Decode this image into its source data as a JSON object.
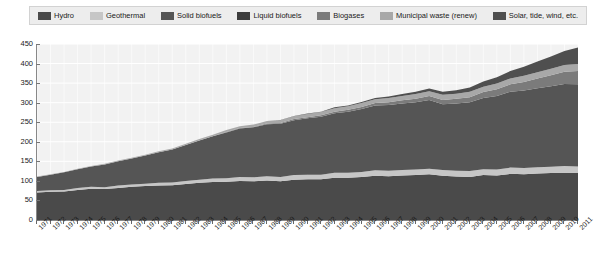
{
  "legend": {
    "items": [
      {
        "label": "Hydro",
        "color": "#4a4a4a",
        "key": "hydro"
      },
      {
        "label": "Geothermal",
        "color": "#c6c6c6",
        "key": "geothermal"
      },
      {
        "label": "Solid biofuels",
        "color": "#555555",
        "key": "solid_biofuels"
      },
      {
        "label": "Liquid biofuels",
        "color": "#3c3c3c",
        "key": "liquid_biofuels"
      },
      {
        "label": "Biogases",
        "color": "#7b7b7b",
        "key": "biogases"
      },
      {
        "label": "Municipal waste (renew)",
        "color": "#a8a8a8",
        "key": "municipal_waste"
      },
      {
        "label": "Solar, tide, wind, etc.",
        "color": "#4f4f4f",
        "key": "solar_tide_wind"
      }
    ]
  },
  "chart_data": {
    "type": "area",
    "stacked": true,
    "title": "",
    "subtitle": "",
    "xlabel": "",
    "ylabel": "",
    "grid": true,
    "legend_position": "top",
    "ylim": [
      0,
      450
    ],
    "ytick_labels": [
      "0",
      "50",
      "100",
      "150",
      "200",
      "250",
      "300",
      "350",
      "400",
      "450"
    ],
    "ytick_values": [
      0,
      50,
      100,
      150,
      200,
      250,
      300,
      350,
      400,
      450
    ],
    "categories": [
      "1971",
      "1972",
      "1973",
      "1974",
      "1975",
      "1976",
      "1977",
      "1978",
      "1979",
      "1980",
      "1981",
      "1982",
      "1983",
      "1984",
      "1985",
      "1986",
      "1987",
      "1988",
      "1989",
      "1990",
      "1991",
      "1992",
      "1993",
      "1994",
      "1995",
      "1996",
      "1997",
      "1998",
      "1999",
      "2000",
      "2001",
      "2002",
      "2003",
      "2004",
      "2005",
      "2006",
      "2007",
      "2008",
      "2009",
      "2010",
      "2011"
    ],
    "series": [
      {
        "name": "Hydro",
        "color": "#4a4a4a",
        "values": [
          70,
          72,
          73,
          77,
          80,
          79,
          82,
          85,
          87,
          88,
          89,
          92,
          95,
          97,
          98,
          100,
          99,
          101,
          99,
          103,
          104,
          104,
          108,
          108,
          110,
          113,
          112,
          114,
          115,
          117,
          113,
          111,
          110,
          115,
          114,
          118,
          117,
          119,
          120,
          121,
          120
        ]
      },
      {
        "name": "Geothermal",
        "color": "#c6c6c6",
        "values": [
          4,
          4,
          4,
          5,
          5,
          5,
          6,
          6,
          6,
          7,
          7,
          8,
          8,
          9,
          9,
          10,
          10,
          11,
          11,
          12,
          12,
          12,
          13,
          13,
          13,
          14,
          14,
          14,
          14,
          14,
          15,
          15,
          15,
          15,
          15,
          16,
          16,
          16,
          16,
          17,
          17
        ]
      },
      {
        "name": "Solid biofuels",
        "color": "#555555",
        "values": [
          36,
          40,
          45,
          48,
          52,
          58,
          62,
          66,
          72,
          78,
          84,
          92,
          100,
          108,
          117,
          124,
          128,
          133,
          136,
          140,
          144,
          148,
          152,
          156,
          161,
          166,
          168,
          170,
          172,
          176,
          168,
          172,
          176,
          182,
          188,
          194,
          198,
          202,
          206,
          210,
          210
        ]
      },
      {
        "name": "Liquid biofuels",
        "color": "#3c3c3c",
        "values": [
          0,
          0,
          0,
          0,
          0,
          0,
          0,
          0,
          0,
          0,
          0,
          0,
          0,
          0,
          0,
          0,
          0,
          0,
          0,
          0,
          0,
          0,
          0,
          0,
          0,
          0,
          0,
          0,
          0,
          0,
          0,
          0,
          0,
          0,
          0,
          0,
          0,
          0,
          0,
          0,
          0
        ]
      },
      {
        "name": "Biogases",
        "color": "#7b7b7b",
        "values": [
          0,
          0,
          0,
          0,
          0,
          0,
          0,
          0,
          0,
          0,
          0,
          0,
          0,
          0,
          1,
          1,
          1,
          2,
          2,
          3,
          3,
          4,
          4,
          5,
          5,
          6,
          7,
          8,
          9,
          10,
          11,
          12,
          13,
          15,
          17,
          19,
          22,
          25,
          28,
          31,
          34
        ]
      },
      {
        "name": "Municipal waste (renew)",
        "color": "#a8a8a8",
        "values": [
          1,
          1,
          1,
          1,
          1,
          2,
          2,
          2,
          2,
          3,
          3,
          3,
          4,
          4,
          5,
          5,
          6,
          6,
          7,
          7,
          8,
          8,
          9,
          9,
          10,
          10,
          11,
          11,
          12,
          12,
          13,
          13,
          14,
          14,
          15,
          15,
          16,
          16,
          17,
          17,
          18
        ]
      },
      {
        "name": "Solar, tide, wind, etc.",
        "color": "#4f4f4f",
        "values": [
          0,
          0,
          0,
          0,
          0,
          0,
          0,
          0,
          0,
          0,
          0,
          0,
          0,
          0,
          0,
          0,
          0,
          0,
          1,
          1,
          1,
          1,
          2,
          2,
          3,
          3,
          4,
          5,
          6,
          7,
          8,
          9,
          11,
          13,
          16,
          19,
          23,
          27,
          31,
          36,
          42
        ]
      }
    ]
  }
}
